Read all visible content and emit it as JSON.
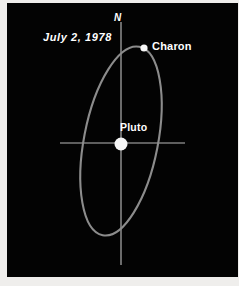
{
  "figure": {
    "kind": "astronomical-orbit-diagram",
    "background_color": "#030303",
    "border_color": "#efeeec",
    "line_color": "#b9b9b9",
    "orbit_color": "#8c8c8c",
    "body_color": "#f6f6f6",
    "width": 239,
    "height": 286
  },
  "labels": {
    "north": "N",
    "date": "July 2, 1978",
    "charon": "Charon",
    "pluto": "Pluto"
  },
  "chart_data": {
    "type": "scatter",
    "title": "July 2, 1978",
    "xlabel": "",
    "ylabel": "",
    "grid": false,
    "legend": "none",
    "annotations": [
      "N",
      "July 2, 1978",
      "Charon",
      "Pluto"
    ],
    "axes": {
      "vertical": {
        "label": "N",
        "x": 121,
        "y_start": 22,
        "y_end": 265,
        "orientation": "north-south"
      },
      "horizontal": {
        "label": "",
        "y": 143,
        "x_start": 60,
        "x_end": 185,
        "orientation": "east-west"
      }
    },
    "orbit": {
      "name": "Charon orbit about Pluto",
      "shape": "ellipse",
      "center_x": 121,
      "center_y": 141,
      "semi_major_px": 96,
      "semi_minor_px": 37,
      "tilt_degrees": 11,
      "stroke_width_px": 2.1
    },
    "bodies": [
      {
        "name": "Pluto",
        "x": 121,
        "y": 144,
        "radius_px": 6.5,
        "color": "#f6f6f6"
      },
      {
        "name": "Charon",
        "x": 144,
        "y": 48,
        "radius_px": 3.6,
        "color": "#f6f6f6"
      }
    ]
  }
}
